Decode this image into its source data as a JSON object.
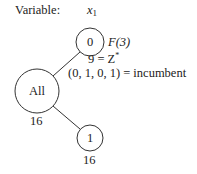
{
  "header": {
    "variable_label": "Variable:",
    "variable_symbol": "x",
    "variable_subscript": "1"
  },
  "tree": {
    "root": {
      "id": "all",
      "label": "All",
      "bound": "16"
    },
    "nodes": [
      {
        "id": "node-0",
        "label": "0",
        "status": "F(3)",
        "annotation_line1_value": "9",
        "annotation_line1_eq": " = Z",
        "annotation_line1_sup": "*",
        "annotation_line2": "(0, 1, 0, 1) = incumbent"
      },
      {
        "id": "node-1",
        "label": "1",
        "bound": "16"
      }
    ],
    "edges": [
      {
        "from": "all",
        "to": "node-0"
      },
      {
        "from": "all",
        "to": "node-1"
      }
    ]
  },
  "colors": {
    "stroke": "#333333",
    "text": "#222222",
    "background": "#ffffff"
  }
}
